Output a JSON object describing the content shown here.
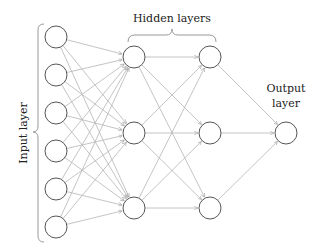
{
  "diagram": {
    "labels": {
      "input": "Input layer",
      "hidden": "Hidden layers",
      "output_line1": "Output",
      "output_line2": "layer"
    },
    "layers": [
      {
        "name": "input",
        "x": 56,
        "nodes": [
          37,
          75,
          113,
          151,
          189,
          227
        ]
      },
      {
        "name": "hidden-1",
        "x": 134,
        "nodes": [
          57,
          133,
          208
        ]
      },
      {
        "name": "hidden-2",
        "x": 210,
        "nodes": [
          57,
          133,
          208
        ]
      },
      {
        "name": "output",
        "x": 286,
        "nodes": [
          133
        ]
      }
    ],
    "node_radius": 11,
    "colors": {
      "node_stroke": "#555555",
      "edge": "#b5b5b5",
      "text": "#222222"
    }
  }
}
